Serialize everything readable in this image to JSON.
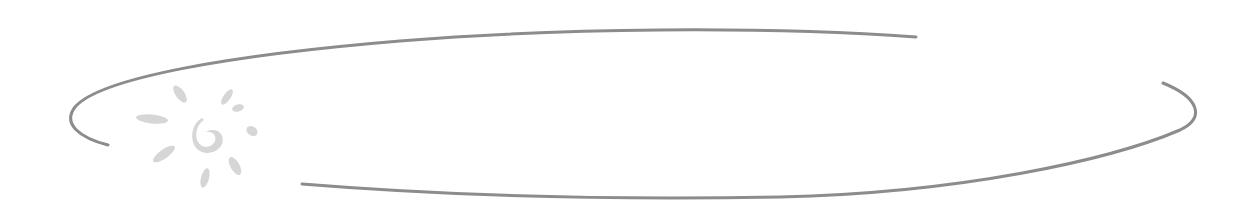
{
  "graphic": {
    "description": "Decorative broken ellipse banner with sun logo",
    "colors": {
      "background": "#ffffff",
      "ellipse_stroke": "#8c8c8c",
      "sun_fill": "#d6d6d6"
    },
    "logo": {
      "icon": "sun-logo-icon"
    }
  }
}
